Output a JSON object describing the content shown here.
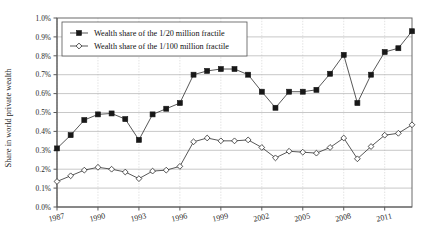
{
  "chart_data": {
    "type": "line",
    "title": "",
    "xlabel": "",
    "ylabel": "Share in world private wealth",
    "ylim": [
      0.0,
      1.0
    ],
    "ytick_labels": [
      "0.0%",
      "0.1%",
      "0.2%",
      "0.3%",
      "0.4%",
      "0.5%",
      "0.6%",
      "0.7%",
      "0.8%",
      "0.9%",
      "1.0%"
    ],
    "ytick_values": [
      0.0,
      0.1,
      0.2,
      0.3,
      0.4,
      0.5,
      0.6,
      0.7,
      0.8,
      0.9,
      1.0
    ],
    "xtick_labels": [
      "1987",
      "1990",
      "1993",
      "1996",
      "1999",
      "2002",
      "2005",
      "2008",
      "2011"
    ],
    "xtick_values": [
      1987,
      1990,
      1993,
      1996,
      1999,
      2002,
      2005,
      2008,
      2011
    ],
    "xlim": [
      1987,
      2013
    ],
    "x": [
      1987,
      1988,
      1989,
      1990,
      1991,
      1992,
      1993,
      1994,
      1995,
      1996,
      1997,
      1998,
      1999,
      2000,
      2001,
      2002,
      2003,
      2004,
      2005,
      2006,
      2007,
      2008,
      2009,
      2010,
      2011,
      2012,
      2013
    ],
    "grid": "horizontal-and-vertical",
    "legend_position": "top-left-inside",
    "series": [
      {
        "name": "Wealth share of the 1/20 million fractile",
        "marker": "filled-square",
        "color": "#181818",
        "values": [
          0.31,
          0.38,
          0.46,
          0.49,
          0.495,
          0.465,
          0.355,
          0.49,
          0.52,
          0.55,
          0.7,
          0.72,
          0.73,
          0.73,
          0.7,
          0.61,
          0.525,
          0.61,
          0.61,
          0.62,
          0.705,
          0.805,
          0.55,
          0.7,
          0.82,
          0.84,
          0.93
        ]
      },
      {
        "name": "Wealth share of the 1/100 million fractile",
        "marker": "open-diamond",
        "color": "#2a2a2a",
        "values": [
          0.135,
          0.165,
          0.195,
          0.21,
          0.2,
          0.185,
          0.15,
          0.19,
          0.195,
          0.215,
          0.345,
          0.365,
          0.35,
          0.35,
          0.355,
          0.315,
          0.26,
          0.295,
          0.29,
          0.285,
          0.315,
          0.365,
          0.255,
          0.32,
          0.38,
          0.39,
          0.435
        ]
      }
    ]
  },
  "legend": {
    "entries": [
      {
        "label": "Wealth share of the 1/20 million fractile",
        "marker": "filled-square"
      },
      {
        "label": "Wealth share of the 1/100 million fractile",
        "marker": "open-diamond"
      }
    ]
  }
}
